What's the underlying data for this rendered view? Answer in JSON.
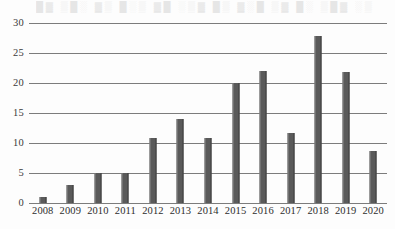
{
  "chart_data": {
    "type": "bar",
    "title": "",
    "subtitle": "",
    "xlabel": "",
    "ylabel": "",
    "categories": [
      "2008",
      "2009",
      "2010",
      "2011",
      "2012",
      "2013",
      "2014",
      "2015",
      "2016",
      "2017",
      "2018",
      "2019",
      "2020"
    ],
    "values": [
      1,
      3,
      5,
      5,
      10.8,
      14,
      10.8,
      20,
      22,
      11.7,
      27.8,
      21.8,
      8.6
    ],
    "series": [
      {
        "name": "",
        "values": [
          1,
          3,
          5,
          5,
          10.8,
          14,
          10.8,
          20,
          22,
          11.7,
          27.8,
          21.8,
          8.6
        ]
      }
    ],
    "ylim": [
      0,
      30
    ],
    "yticks": [
      0,
      5,
      10,
      15,
      20,
      25,
      30
    ],
    "ytick_labels": [
      "0",
      "5",
      "10",
      "15",
      "20",
      "25",
      "30"
    ],
    "grid": true,
    "grid_axis": "y",
    "legend": false,
    "legend_position": "none",
    "bar_color": "#5a5a5a",
    "grid_color": "#7c7c7c",
    "background_color": "#fdfdfd",
    "text_color": "#2e2e2e"
  },
  "artifacts": {
    "bleed_text": "█▓ ▒█░ ▓▒ █░▒ ▓█ ░▒▓ █▒ ▓░█ ▒▓ █░ ▒█▓ ░▒"
  }
}
